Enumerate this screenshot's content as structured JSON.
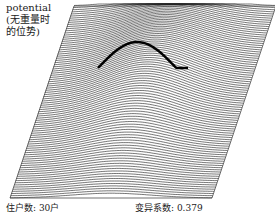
{
  "figure": {
    "type": "3d-wireframe-surface",
    "title_lines": [
      "potential",
      "(无重量时",
      "的位势)"
    ],
    "surface_description": "Potential surface (without weights) drawn as dense horizontal profile lines over a sheared parallelogram base; a single central hill with a sharp dark crest near the upper middle.",
    "line_color": "#1a1a1a",
    "crest_color": "#000000"
  },
  "footer": {
    "households_label": "住户数: 30户",
    "cv_label": "变异系数: 0.379"
  },
  "surface_model": {
    "profile_count": 90,
    "peak_u": 0.5,
    "peak_v": 0.25,
    "peak_height": 0.55,
    "spread_u": 0.28,
    "spread_v": 0.5
  }
}
